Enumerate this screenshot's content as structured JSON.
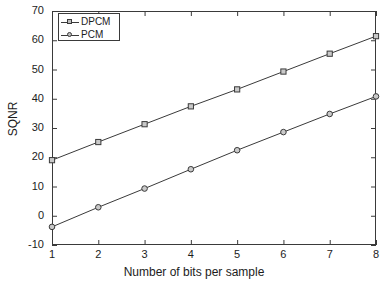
{
  "chart_data": {
    "type": "line",
    "title": "",
    "xlabel": "Number of bits per sample",
    "ylabel": "SQNR",
    "x": [
      1,
      2,
      3,
      4,
      5,
      6,
      7,
      8
    ],
    "xlim": [
      1,
      8
    ],
    "ylim": [
      -10,
      70
    ],
    "xticks": [
      "1",
      "2",
      "3",
      "4",
      "5",
      "6",
      "7",
      "8"
    ],
    "yticks": [
      "-10",
      "0",
      "10",
      "20",
      "30",
      "40",
      "50",
      "60",
      "70"
    ],
    "grid": false,
    "legend_position": "top-left",
    "series": [
      {
        "name": "DPCM",
        "marker": "square",
        "color": "#3a3a3a",
        "values": [
          19.0,
          25.2,
          31.3,
          37.4,
          43.2,
          49.3,
          55.4,
          61.4
        ]
      },
      {
        "name": "PCM",
        "marker": "circle",
        "color": "#3a3a3a",
        "values": [
          -3.8,
          2.9,
          9.3,
          15.9,
          22.4,
          28.6,
          34.8,
          40.8
        ]
      }
    ]
  },
  "legend": {
    "items": [
      {
        "label": "DPCM"
      },
      {
        "label": "PCM"
      }
    ]
  },
  "axes": {
    "x_title": "Number of bits per sample",
    "y_title": "SQNR",
    "y_tick_labels": [
      "70",
      "60",
      "50",
      "40",
      "30",
      "20",
      "10",
      "0",
      "-10"
    ],
    "x_tick_labels": [
      "1",
      "2",
      "3",
      "4",
      "5",
      "6",
      "7",
      "8"
    ]
  }
}
